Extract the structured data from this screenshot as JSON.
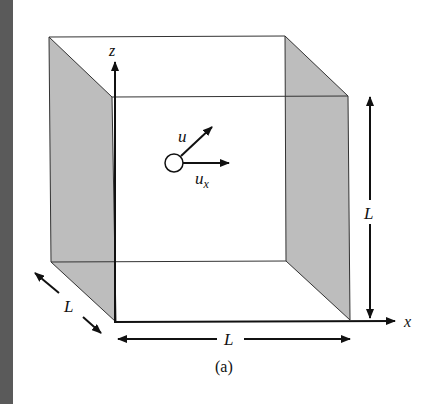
{
  "figure": {
    "caption": "(a)",
    "labels": {
      "z_axis": "z",
      "x_axis": "x",
      "velocity": "u",
      "velocity_x_sub_base": "u",
      "velocity_x_sub": "x",
      "depth": "L",
      "width": "L",
      "height": "L"
    },
    "colors": {
      "shaded_face": "#bdbdbd",
      "lines": "#111111",
      "page_edge": "#5a5a5a",
      "background": "#ffffff"
    }
  }
}
